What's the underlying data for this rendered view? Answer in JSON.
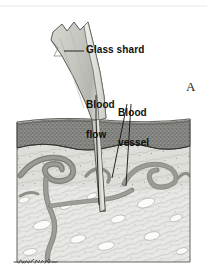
{
  "figure": {
    "panel_letter": "A",
    "signature": "Jean M. Beck",
    "background_color": "#ffffff",
    "ink_color": "#100f0d"
  },
  "labels": {
    "glass_shard": "Glass shard",
    "blood_flow_line1": "Blood",
    "blood_flow_line2": "flow",
    "blood_vessel_line1": "Blood",
    "blood_vessel_line2": "vessel"
  },
  "anatomy": {
    "epidermis": {
      "name": "epidermis-layer",
      "color": "#8d8d8a",
      "stipple_color": "#4a4a47"
    },
    "dermis_upper": {
      "name": "papillary-dermis",
      "color": "#dcdcd8"
    },
    "dermis_deep": {
      "name": "reticular-dermis",
      "color": "#e8e8e5"
    },
    "blood_vessels": {
      "name": "vessel-network",
      "color": "#8a8a87",
      "outline_color": "#3c3c39"
    },
    "glass_shard": {
      "name": "glass-shard-object",
      "fill_color": "#c9c9c4",
      "highlight_color": "#eceae5",
      "outline_color": "#4a4a47"
    },
    "wound_channel": {
      "name": "wound-channel",
      "color": "#6f6f6b"
    }
  },
  "icons": {
    "leader_line": "leader-line",
    "signature_mark": "artist-signature"
  }
}
